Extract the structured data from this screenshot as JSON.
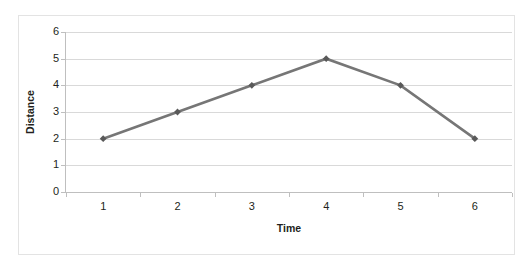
{
  "chart_data": {
    "type": "line",
    "title": "",
    "xlabel": "Time",
    "ylabel": "Distance",
    "categories": [
      "1",
      "2",
      "3",
      "4",
      "5",
      "6"
    ],
    "x": [
      1,
      2,
      3,
      4,
      5,
      6
    ],
    "values": [
      2,
      3,
      4,
      5,
      4,
      2
    ],
    "series": [
      {
        "name": "Distance",
        "values": [
          2,
          3,
          4,
          5,
          4,
          2
        ]
      }
    ],
    "ylim": [
      0,
      6
    ],
    "y_ticks": [
      "0",
      "1",
      "2",
      "3",
      "4",
      "5",
      "6"
    ],
    "y_tick_values": [
      0,
      1,
      2,
      3,
      4,
      5,
      6
    ],
    "x_tick_labels": [
      "1",
      "2",
      "3",
      "4",
      "5",
      "6"
    ],
    "grid": "horizontal",
    "legend": "none",
    "marker": "diamond",
    "line_color": "#767676",
    "marker_color": "#595959",
    "gridline_color": "#d9d9d9",
    "axis_color": "#bfbfbf",
    "text_color": "#231f20",
    "plot_background": "#ffffff",
    "annotations": []
  }
}
